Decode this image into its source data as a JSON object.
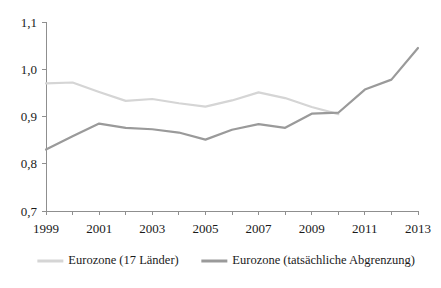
{
  "chart_data": {
    "type": "line",
    "title": "",
    "subtitle": "",
    "xlabel": "",
    "ylabel": "",
    "xlim": [
      1999,
      2013
    ],
    "ylim": [
      0.7,
      1.1
    ],
    "grid": false,
    "legend_position": "bottom",
    "x": [
      1999,
      2000,
      2001,
      2002,
      2003,
      2004,
      2005,
      2006,
      2007,
      2008,
      2009,
      2010,
      2011,
      2012,
      2013
    ],
    "y_ticks": [
      0.7,
      0.8,
      0.9,
      1.0,
      1.1
    ],
    "y_tick_labels": [
      "0,7",
      "0,8",
      "0,9",
      "1,0",
      "1,1"
    ],
    "x_ticks": [
      1999,
      2000,
      2001,
      2002,
      2003,
      2004,
      2005,
      2006,
      2007,
      2008,
      2009,
      2010,
      2011,
      2012,
      2013
    ],
    "x_tick_labels": [
      "1999",
      "",
      "2001",
      "",
      "2003",
      "",
      "2005",
      "",
      "2007",
      "",
      "2009",
      "",
      "2011",
      "",
      "2013"
    ],
    "series": [
      {
        "name": "Eurozone (17 Länder)",
        "color": "#d5d5d5",
        "x": [
          1999,
          2000,
          2001,
          2002,
          2003,
          2004,
          2005,
          2006,
          2007,
          2008,
          2009,
          2010
        ],
        "values": [
          0.97,
          0.972,
          0.952,
          0.933,
          0.937,
          0.928,
          0.921,
          0.934,
          0.951,
          0.939,
          0.92,
          0.905
        ]
      },
      {
        "name": "Eurozone (tatsächliche Abgrenzung)",
        "color": "#9a9a9a",
        "x": [
          1999,
          2000,
          2001,
          2002,
          2003,
          2004,
          2005,
          2006,
          2007,
          2008,
          2009,
          2010,
          2011,
          2012,
          2013
        ],
        "values": [
          0.83,
          0.858,
          0.885,
          0.876,
          0.873,
          0.866,
          0.851,
          0.872,
          0.884,
          0.876,
          0.906,
          0.908,
          0.957,
          0.978,
          1.045
        ]
      }
    ]
  },
  "legend": {
    "items": [
      {
        "label": "Eurozone (17 Länder)"
      },
      {
        "label": "Eurozone (tatsächliche Abgrenzung)"
      }
    ]
  }
}
